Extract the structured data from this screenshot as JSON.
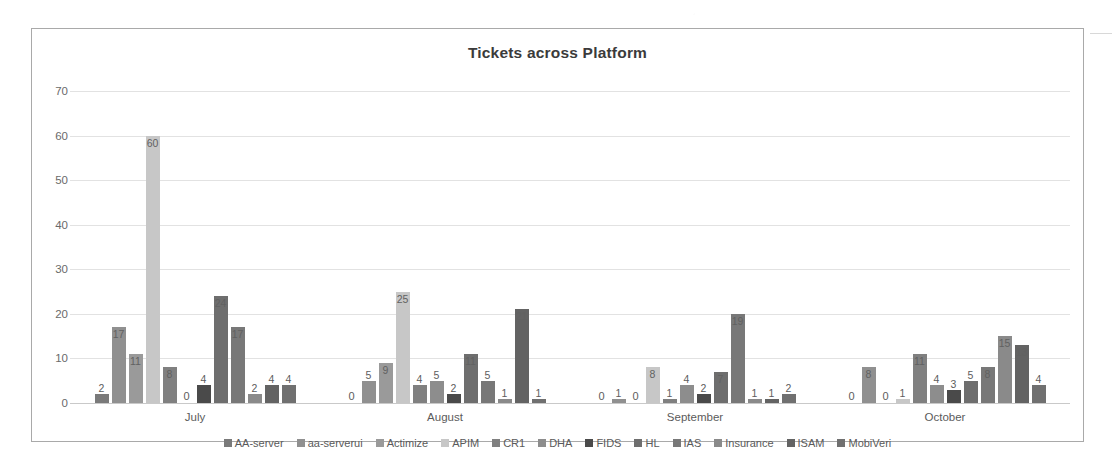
{
  "chart_data": {
    "type": "bar",
    "title": "Tickets across Platform",
    "xlabel": "",
    "ylabel": "",
    "ylim": [
      0,
      70
    ],
    "yticks": [
      0,
      10,
      20,
      30,
      40,
      50,
      60,
      70
    ],
    "grid": true,
    "legend_position": "bottom",
    "categories": [
      "July",
      "August",
      "September",
      "October"
    ],
    "series": [
      {
        "name": "AA-server",
        "color": "#7a7a7a",
        "values": [
          2,
          0,
          0,
          0
        ]
      },
      {
        "name": "aa-serverui",
        "color": "#909090",
        "values": [
          17,
          5,
          1,
          8
        ]
      },
      {
        "name": "Actimize",
        "color": "#9a9a9a",
        "values": [
          11,
          9,
          0,
          0
        ]
      },
      {
        "name": "APIM",
        "color": "#c7c7c7",
        "values": [
          60,
          25,
          8,
          1
        ]
      },
      {
        "name": "CR1",
        "color": "#808080",
        "values": [
          8,
          4,
          1,
          11
        ]
      },
      {
        "name": "DHA",
        "color": "#8d8d8d",
        "values": [
          0,
          5,
          4,
          4
        ]
      },
      {
        "name": "FIDS",
        "color": "#4a4a4a",
        "values": [
          4,
          2,
          2,
          3
        ]
      },
      {
        "name": "HL",
        "color": "#6e6e6e",
        "values": [
          24,
          11,
          7,
          5
        ]
      },
      {
        "name": "IAS",
        "color": "#787878",
        "values": [
          17,
          5,
          20,
          8
        ]
      },
      {
        "name": "Insurance",
        "color": "#8a8a8a",
        "values": [
          2,
          1,
          1,
          15
        ]
      },
      {
        "name": "ISAM",
        "color": "#636363",
        "values": [
          4,
          21,
          1,
          13
        ]
      },
      {
        "name": "MobiVeri",
        "color": "#707070",
        "values": [
          4,
          1,
          2,
          4
        ]
      }
    ],
    "data_labels": {
      "July": [
        "2",
        "17",
        "11",
        "60",
        "8",
        "0",
        "4",
        "24",
        "17",
        "2",
        "4",
        "4"
      ],
      "August": [
        "0",
        "5",
        "9",
        "25",
        "4",
        "5",
        "2",
        "11",
        "5",
        "1",
        "21",
        "1"
      ],
      "September": [
        "0",
        "1",
        "0",
        "8",
        "1",
        "4",
        "2",
        "7",
        "19",
        "1",
        "1",
        "2"
      ],
      "October": [
        "0",
        "8",
        "0",
        "1",
        "11",
        "4",
        "3",
        "5",
        "8",
        "15",
        "13",
        "4"
      ]
    }
  }
}
